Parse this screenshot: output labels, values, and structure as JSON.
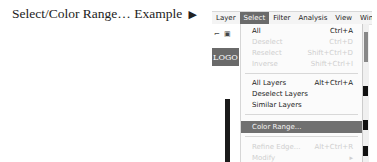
{
  "caption": {
    "text": "Select/Color Range…  Example",
    "arrow": "▶"
  },
  "menubar": {
    "items": [
      {
        "label": "Layer"
      },
      {
        "label": "Select",
        "active": true
      },
      {
        "label": "Filter"
      },
      {
        "label": "Analysis"
      },
      {
        "label": "View"
      },
      {
        "label": "Windo"
      }
    ]
  },
  "left_panel": {
    "tool_icons": "⌐ ▣",
    "logo": "LOGO"
  },
  "dropdown": {
    "items": [
      {
        "label": "All",
        "shortcut": "Ctrl+A",
        "disabled": false
      },
      {
        "label": "Deselect",
        "shortcut": "Ctrl+D",
        "disabled": true
      },
      {
        "label": "Reselect",
        "shortcut": "Shift+Ctrl+D",
        "disabled": true
      },
      {
        "label": "Inverse",
        "shortcut": "Shift+Ctrl+I",
        "disabled": true
      },
      {
        "label": "All Layers",
        "shortcut": "Alt+Ctrl+A",
        "disabled": false
      },
      {
        "label": "Deselect Layers",
        "shortcut": "",
        "disabled": false
      },
      {
        "label": "Similar Layers",
        "shortcut": "",
        "disabled": false
      },
      {
        "label": "Color Range...",
        "shortcut": "",
        "disabled": false,
        "highlighted": true
      },
      {
        "label": "Refine Edge...",
        "shortcut": "Alt+Ctrl+R",
        "disabled": true
      },
      {
        "label": "Modify",
        "shortcut": "▸",
        "disabled": true
      }
    ]
  }
}
